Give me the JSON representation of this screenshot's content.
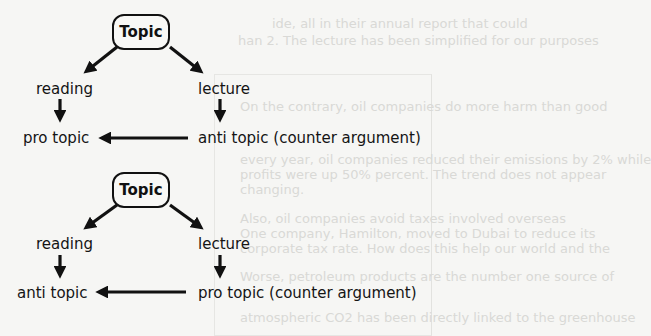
{
  "diagram_1": {
    "topic": "Topic",
    "left_source": "reading",
    "right_source": "lecture",
    "left_result": "pro topic",
    "right_result": "anti topic (counter argument)"
  },
  "diagram_2": {
    "topic": "Topic",
    "left_source": "reading",
    "right_source": "lecture",
    "left_result": "anti topic",
    "right_result": "pro topic (counter argument)"
  },
  "background_text": {
    "lines": [
      "ide, all in their annual report that could",
      "han 2. The lecture has been simplified for our purposes",
      "On the contrary, oil companies do more harm than good",
      "every year, oil companies reduced their emissions by 2% while",
      "profits were up 50% percent. The trend does not appear",
      "changing.",
      "Also, oil companies avoid taxes involved overseas",
      "One company, Hamilton, moved to Dubai to reduce its",
      "corporate tax rate. How does this help our world and the",
      "Worse, petroleum products are the number one source of",
      "atmospheric CO2 has been directly linked to the greenhouse"
    ]
  },
  "colors": {
    "ink": "#111111",
    "background": "#f6f6f4",
    "faded_text": "#d9d9d6"
  }
}
